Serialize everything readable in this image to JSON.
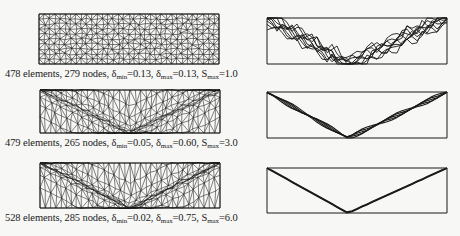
{
  "figure": {
    "rows": [
      {
        "mesh": {
          "box": [
            38,
            13,
            180,
            50
          ],
          "grading": 0.0,
          "seed": 11
        },
        "caption": {
          "pos": [
            5,
            68
          ],
          "elements": "478 elements",
          "nodes": "279 nodes",
          "delta_min_label": "δ",
          "delta_min_sub": "min",
          "delta_min_value": "=0.13",
          "delta_max_label": "δ",
          "delta_max_sub": "max",
          "delta_max_value": "=0.13",
          "s_max_label": "S",
          "s_max_sub": "max",
          "s_max_value": "=1.0"
        },
        "solution": {
          "box": [
            266,
            17,
            180,
            46
          ],
          "vertex_x": 347,
          "spread": 6,
          "style": "jagged"
        }
      },
      {
        "mesh": {
          "box": [
            39,
            89,
            180,
            43
          ],
          "grading": 1.0,
          "seed": 23
        },
        "caption": {
          "pos": [
            5,
            137
          ],
          "elements": "479 elements",
          "nodes": "265 nodes",
          "delta_min_label": "δ",
          "delta_min_sub": "min",
          "delta_min_value": "=0.05",
          "delta_max_label": "δ",
          "delta_max_sub": "max",
          "delta_max_value": "=0.60",
          "s_max_label": "S",
          "s_max_sub": "max",
          "s_max_value": "=3.0"
        },
        "solution": {
          "box": [
            266,
            91,
            180,
            46
          ],
          "vertex_x": 347,
          "spread": 2.2,
          "style": "wavy"
        }
      },
      {
        "mesh": {
          "box": [
            39,
            162,
            180,
            45
          ],
          "grading": 1.6,
          "seed": 37
        },
        "caption": {
          "pos": [
            5,
            212
          ],
          "elements": "528 elements",
          "nodes": "285 nodes",
          "delta_min_label": "δ",
          "delta_min_sub": "min",
          "delta_min_value": "=0.02",
          "delta_max_label": "δ",
          "delta_max_sub": "max",
          "delta_max_value": "=0.75",
          "s_max_label": "S",
          "s_max_sub": "max",
          "s_max_value": "=6.0"
        },
        "solution": {
          "box": [
            266,
            167,
            180,
            45
          ],
          "vertex_x": 347,
          "spread": 1.0,
          "style": "sharp"
        }
      }
    ],
    "colors": {
      "ink": "#1a1a1a",
      "paper": "#f7f7f5"
    }
  }
}
